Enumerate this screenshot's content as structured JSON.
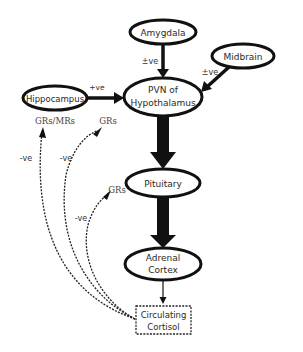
{
  "diagram": {
    "nodes": {
      "amygdala": {
        "label": "Amygdala"
      },
      "midbrain": {
        "label": "Midbrain"
      },
      "hippocampus": {
        "label": "Hippocampus"
      },
      "pvn": {
        "line1": "PVN of",
        "line2": "Hypothalamus"
      },
      "pituitary": {
        "label": "Pituitary"
      },
      "adrenal": {
        "line1": "Adrenal",
        "line2": "Cortex"
      },
      "cortisol": {
        "line1": "Circulating",
        "line2": "Cortisol"
      }
    },
    "edge_labels": {
      "amygdala_to_pvn": "±ve",
      "midbrain_to_pvn": "±ve",
      "hippocampus_to_pvn": "+ve",
      "feedback_hippocampus_outer": "-ve",
      "feedback_hippocampus_inner": "-ve",
      "feedback_pituitary": "-ve"
    },
    "receptor_labels": {
      "hippocampus_receptors": "GRs/MRs",
      "pvn_receptors": "GRs",
      "pituitary_receptors": "GRs"
    },
    "colors": {
      "stroke": "#111111",
      "text": "#2a2a2a",
      "background": "#ffffff"
    }
  }
}
